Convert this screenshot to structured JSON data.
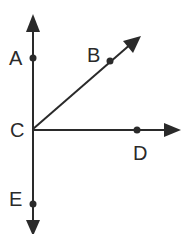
{
  "diagram": {
    "type": "rays-from-point",
    "vertex": "C",
    "stroke_color": "#2a2a2a",
    "points": {
      "A": {
        "label": "A",
        "x": 33,
        "y": 58
      },
      "B": {
        "label": "B",
        "x": 110,
        "y": 61
      },
      "C": {
        "label": "C",
        "x": 33,
        "y": 129
      },
      "D": {
        "label": "D",
        "x": 137,
        "y": 130
      },
      "E": {
        "label": "E",
        "x": 33,
        "y": 204
      }
    },
    "rays": [
      {
        "name": "CA",
        "through": "A",
        "direction": "up"
      },
      {
        "name": "CB",
        "through": "B",
        "direction": "up-right"
      },
      {
        "name": "CD",
        "through": "D",
        "direction": "right"
      },
      {
        "name": "CE",
        "through": "E",
        "direction": "down"
      }
    ]
  }
}
